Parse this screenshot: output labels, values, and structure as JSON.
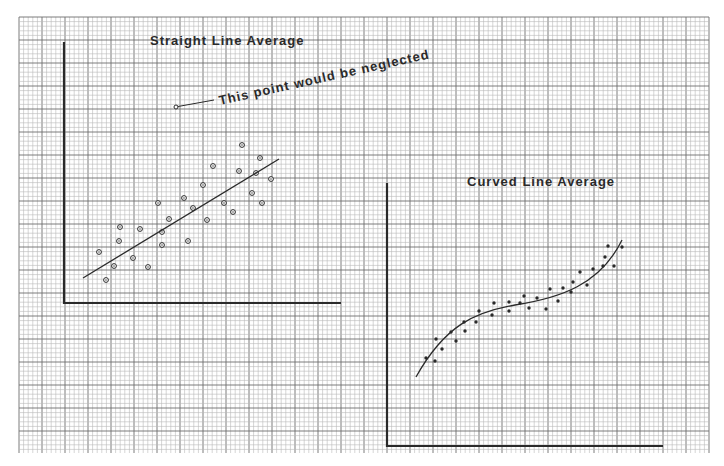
{
  "paper": {
    "grid": {
      "x0": 19,
      "y0": 17,
      "x1": 709,
      "y1": 453,
      "minor": 4.6,
      "major_every": 5,
      "minor_color": "#b8b8b8",
      "major_color": "#6e6e6e"
    },
    "ink_color": "#2a2a2a"
  },
  "chart_data": [
    {
      "type": "scatter",
      "title": "Straight Line Average",
      "xlabel": "",
      "ylabel": "",
      "grid": true,
      "axes_px": {
        "origin": [
          64,
          303
        ],
        "y_top": 42,
        "x_right": 341
      },
      "marker": "open-circle",
      "points_px": [
        [
          99,
          252
        ],
        [
          106,
          280
        ],
        [
          114,
          266
        ],
        [
          119,
          241
        ],
        [
          120,
          227
        ],
        [
          133,
          258
        ],
        [
          140,
          229
        ],
        [
          148,
          267
        ],
        [
          158,
          203
        ],
        [
          162,
          232
        ],
        [
          162,
          245
        ],
        [
          169,
          219
        ],
        [
          184,
          198
        ],
        [
          188,
          241
        ],
        [
          193,
          208
        ],
        [
          203,
          185
        ],
        [
          207,
          220
        ],
        [
          213,
          166
        ],
        [
          224,
          203
        ],
        [
          233,
          212
        ],
        [
          239,
          171
        ],
        [
          242,
          145
        ],
        [
          252,
          193
        ],
        [
          256,
          173
        ],
        [
          260,
          158
        ],
        [
          262,
          203
        ],
        [
          271,
          179
        ]
      ],
      "fit": {
        "kind": "straight-line",
        "from": [
          83,
          278
        ],
        "to": [
          279,
          159
        ]
      },
      "outlier": {
        "point_px": [
          176,
          107
        ],
        "leader_to": [
          214,
          100
        ],
        "text": "This point would be neglected",
        "text_pos": [
          220,
          105
        ],
        "angle": -12.5
      }
    },
    {
      "type": "scatter",
      "title": "Curved Line Average",
      "xlabel": "",
      "ylabel": "",
      "grid": true,
      "axes_px": {
        "origin": [
          387,
          446
        ],
        "y_top": 183,
        "x_right": 663
      },
      "marker": "filled-dot",
      "points_px": [
        [
          426,
          358
        ],
        [
          435,
          361
        ],
        [
          436,
          339
        ],
        [
          442,
          349
        ],
        [
          451,
          332
        ],
        [
          456,
          341
        ],
        [
          464,
          322
        ],
        [
          465,
          331
        ],
        [
          476,
          322
        ],
        [
          479,
          311
        ],
        [
          492,
          315
        ],
        [
          494,
          303
        ],
        [
          509,
          302
        ],
        [
          509,
          311
        ],
        [
          520,
          303
        ],
        [
          524,
          296
        ],
        [
          529,
          308
        ],
        [
          537,
          298
        ],
        [
          546,
          309
        ],
        [
          550,
          289
        ],
        [
          558,
          301
        ],
        [
          563,
          288
        ],
        [
          571,
          292
        ],
        [
          573,
          282
        ],
        [
          580,
          272
        ],
        [
          587,
          285
        ],
        [
          593,
          269
        ],
        [
          603,
          266
        ],
        [
          605,
          257
        ],
        [
          608,
          246
        ],
        [
          614,
          266
        ],
        [
          622,
          247
        ]
      ],
      "fit": {
        "kind": "cubic-curve",
        "path": "M416,377 C445,325 475,312 515,305 C560,298 600,285 622,240"
      }
    }
  ]
}
